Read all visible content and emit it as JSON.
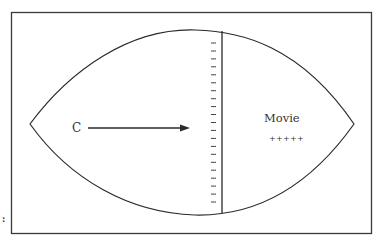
{
  "diagram": {
    "type": "football-shaped field diagram",
    "labels": {
      "left": "C",
      "right_title": "Movie",
      "right_marks": "+++++"
    },
    "tick_count": 21,
    "colors": {
      "stroke": "#2a2a2a",
      "frame": "#3a3a3a",
      "background": "#ffffff"
    },
    "margin_marks": ":"
  }
}
